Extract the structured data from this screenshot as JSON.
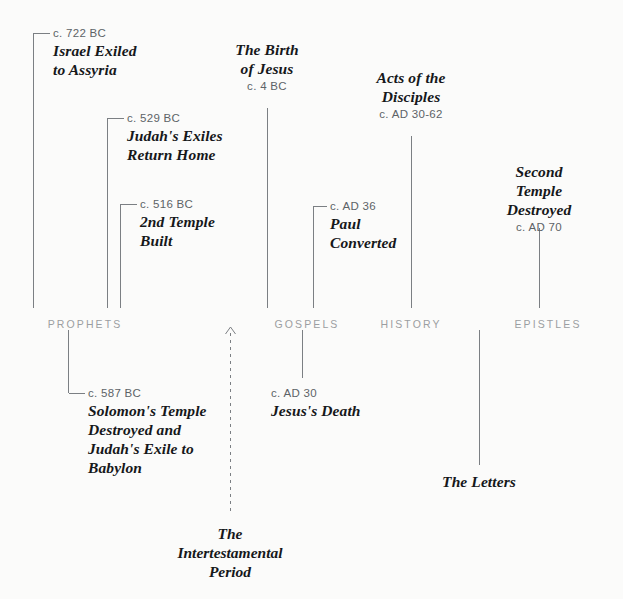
{
  "theme": {
    "background": "#fbfbfa",
    "line_color": "#7b7f83",
    "date_color": "#5d6367",
    "name_color": "#16181a",
    "section_label_color": "#9b9ea1"
  },
  "sections": [
    {
      "id": "prophets",
      "label": "PROPHETS",
      "x": 85,
      "y": 318
    },
    {
      "id": "gospels",
      "label": "GOSPELS",
      "x": 307,
      "y": 318
    },
    {
      "id": "history",
      "label": "HISTORY",
      "x": 411,
      "y": 318
    },
    {
      "id": "epistles",
      "label": "EPISTLES",
      "x": 548,
      "y": 318
    }
  ],
  "events_above": [
    {
      "id": "israel-exiled",
      "date": "c. 722 BC",
      "name": "Israel Exiled\nto Assyria",
      "align": "left",
      "text_x": 53,
      "text_y": 25,
      "stem_x": 33,
      "stem_top": 33,
      "stem_bottom": 308,
      "elbow_to": 50,
      "elbow_y": 33
    },
    {
      "id": "judahs-exiles-return",
      "date": "c. 529 BC",
      "name": "Judah's Exiles\nReturn Home",
      "align": "left",
      "text_x": 127,
      "text_y": 110,
      "stem_x": 107,
      "stem_top": 118,
      "stem_bottom": 308,
      "elbow_to": 124,
      "elbow_y": 118
    },
    {
      "id": "2nd-temple-built",
      "date": "c. 516 BC",
      "name": "2nd Temple\nBuilt",
      "align": "left",
      "text_x": 140,
      "text_y": 196,
      "stem_x": 120,
      "stem_top": 204,
      "stem_bottom": 308,
      "elbow_to": 137,
      "elbow_y": 204
    },
    {
      "id": "birth-of-jesus",
      "date": "c. 4 BC",
      "name": "The Birth\nof Jesus",
      "align": "center",
      "text_x": 267,
      "text_y": 40,
      "date_after": true,
      "stem_x": 267,
      "stem_top": 108,
      "stem_bottom": 308
    },
    {
      "id": "paul-converted",
      "date": "c. AD 36",
      "name": "Paul\nConverted",
      "align": "left",
      "text_x": 330,
      "text_y": 198,
      "stem_x": 313,
      "stem_top": 206,
      "stem_bottom": 308,
      "elbow_to": 327,
      "elbow_y": 206
    },
    {
      "id": "acts-of-the-disciples",
      "date": "c. AD 30-62",
      "name": "Acts of the\nDisciples",
      "align": "center",
      "text_x": 411,
      "text_y": 68,
      "date_after": true,
      "stem_x": 411,
      "stem_top": 136,
      "stem_bottom": 308
    },
    {
      "id": "second-temple-destroyed",
      "date": "c. AD 70",
      "name": "Second Temple\nDestroyed",
      "align": "center",
      "text_x": 539,
      "text_y": 162,
      "date_after": true,
      "stem_x": 539,
      "stem_top": 228,
      "stem_bottom": 308
    }
  ],
  "events_below": [
    {
      "id": "solomons-temple-destroyed",
      "date": "c. 587 BC",
      "name": "Solomon's Temple\nDestroyed and\nJudah's Exile to\nBabylon",
      "align": "left",
      "text_x": 88,
      "text_y": 385,
      "stem_x": 68,
      "stem_top": 330,
      "stem_bottom": 393,
      "elbow_to": 85,
      "elbow_y": 393
    },
    {
      "id": "jesuss-death",
      "date": "c. AD 30",
      "name": "Jesus's Death",
      "align": "left",
      "text_x": 271,
      "text_y": 385,
      "stem_x": 302,
      "stem_top": 330,
      "stem_bottom": 378
    },
    {
      "id": "the-letters",
      "date": "",
      "name": "The Letters",
      "align": "center",
      "text_x": 479,
      "text_y": 472,
      "stem_x": 479,
      "stem_top": 330,
      "stem_bottom": 465
    }
  ],
  "intertestamental": {
    "id": "intertestamental-period",
    "label": "The\nIntertestamental\nPeriod",
    "x": 230,
    "text_y": 524,
    "arrow_top": 327,
    "dash_bottom": 512
  }
}
